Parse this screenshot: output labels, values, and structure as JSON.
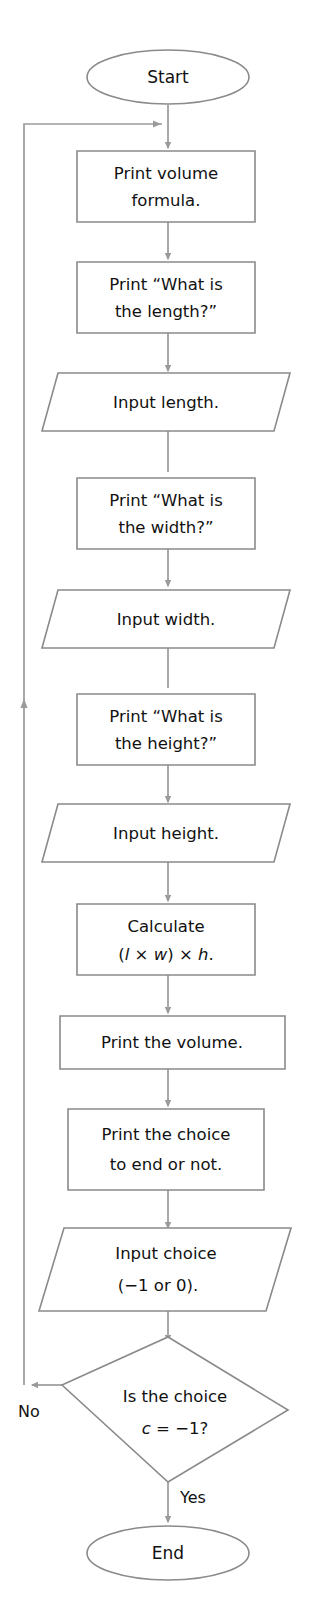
{
  "diagram": {
    "type": "flowchart",
    "stroke_color": "#8a8a8a",
    "connector_color": "#9a9a9a",
    "text_color": "#111111",
    "background_color": "#ffffff"
  },
  "nodes": {
    "start": {
      "shape": "terminator",
      "label": "Start"
    },
    "print_formula": {
      "shape": "process",
      "line1": "Print volume",
      "line2": "formula."
    },
    "print_length_prompt": {
      "shape": "process",
      "line1": "Print “What is",
      "line2": "the length?”"
    },
    "input_length": {
      "shape": "input",
      "label": "Input length."
    },
    "print_width_prompt": {
      "shape": "process",
      "line1": "Print “What is",
      "line2": "the width?”"
    },
    "input_width": {
      "shape": "input",
      "label": "Input width."
    },
    "print_height_prompt": {
      "shape": "process",
      "line1": "Print “What is",
      "line2": "the height?”"
    },
    "input_height": {
      "shape": "input",
      "label": "Input height."
    },
    "calculate": {
      "shape": "process",
      "line1": "Calculate",
      "formula_open": "(",
      "formula_l": "l",
      "formula_times1": " × ",
      "formula_w": "w",
      "formula_close": ") ",
      "formula_times2": "× ",
      "formula_h": "h",
      "formula_period": "."
    },
    "print_volume": {
      "shape": "process",
      "label": "Print the volume."
    },
    "print_choice": {
      "shape": "process",
      "line1": "Print the choice",
      "line2": "to end or not."
    },
    "input_choice": {
      "shape": "input",
      "line1": "Input choice",
      "line2": "(−1 or 0)."
    },
    "decision": {
      "shape": "decision",
      "line1": "Is the choice",
      "line2_var": "c",
      "line2_rest": " = −1?"
    },
    "end": {
      "shape": "terminator",
      "label": "End"
    }
  },
  "branches": {
    "no_label": "No",
    "yes_label": "Yes"
  }
}
